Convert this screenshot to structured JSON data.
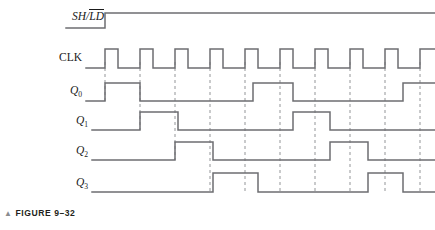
{
  "figure": {
    "caption_marker": "▲",
    "caption": "FIGURE 9–32"
  },
  "style": {
    "trace_color": "#6d6e71",
    "dash_color": "#939598",
    "label_color": "#1a1a1a",
    "background": "#ffffff",
    "trace_width": 1.5,
    "dash_width": 1.0
  },
  "labels": {
    "shld_left": "SH/",
    "shld_overbar": "LD",
    "clk": "CLK",
    "q0": "Q",
    "q0_sub": "0",
    "q1": "Q",
    "q1_sub": "1",
    "q2": "Q",
    "q2_sub": "2",
    "q3": "Q",
    "q3_sub": "3"
  },
  "chart_data": {
    "type": "line",
    "title": "FIGURE 9–32",
    "xlabel": "",
    "ylabel": "",
    "x_start": 105,
    "x_end": 420,
    "clock_period": 35,
    "clock_high_width": 13,
    "clock_pulse_starts": [
      105,
      140,
      175,
      210,
      245,
      280,
      315,
      350,
      385,
      420
    ],
    "gridlines": [
      105,
      140,
      175,
      210,
      245,
      280,
      315,
      350,
      385,
      420
    ],
    "signals": [
      {
        "name": "SH/LD",
        "y_low": 28,
        "y_high": 13,
        "x_from": 66,
        "segments": [
          {
            "x": 66,
            "level": 0
          },
          {
            "x": 105,
            "level": 1
          },
          {
            "x": 435,
            "level": 1
          }
        ]
      },
      {
        "name": "CLK",
        "y_low": 68,
        "y_high": 49,
        "x_from": 86,
        "segments": [
          {
            "x": 86,
            "level": 0
          },
          {
            "x": 105,
            "level": 1
          },
          {
            "x": 118,
            "level": 0
          },
          {
            "x": 140,
            "level": 1
          },
          {
            "x": 153,
            "level": 0
          },
          {
            "x": 175,
            "level": 1
          },
          {
            "x": 188,
            "level": 0
          },
          {
            "x": 210,
            "level": 1
          },
          {
            "x": 223,
            "level": 0
          },
          {
            "x": 245,
            "level": 1
          },
          {
            "x": 258,
            "level": 0
          },
          {
            "x": 280,
            "level": 1
          },
          {
            "x": 293,
            "level": 0
          },
          {
            "x": 315,
            "level": 1
          },
          {
            "x": 328,
            "level": 0
          },
          {
            "x": 350,
            "level": 1
          },
          {
            "x": 363,
            "level": 0
          },
          {
            "x": 385,
            "level": 1
          },
          {
            "x": 398,
            "level": 0
          },
          {
            "x": 420,
            "level": 1
          },
          {
            "x": 435,
            "level": 1
          }
        ]
      },
      {
        "name": "Q0",
        "y_low": 101,
        "y_high": 83,
        "x_from": 86,
        "segments": [
          {
            "x": 86,
            "level": 0
          },
          {
            "x": 105,
            "level": 1
          },
          {
            "x": 140,
            "level": 0
          },
          {
            "x": 253,
            "level": 1
          },
          {
            "x": 293,
            "level": 0
          },
          {
            "x": 403,
            "level": 1
          },
          {
            "x": 435,
            "level": 1
          }
        ]
      },
      {
        "name": "Q1",
        "y_low": 130,
        "y_high": 112,
        "x_from": 92,
        "segments": [
          {
            "x": 92,
            "level": 0
          },
          {
            "x": 140,
            "level": 1
          },
          {
            "x": 178,
            "level": 0
          },
          {
            "x": 293,
            "level": 1
          },
          {
            "x": 330,
            "level": 0
          },
          {
            "x": 435,
            "level": 0
          }
        ]
      },
      {
        "name": "Q2",
        "y_low": 160,
        "y_high": 142,
        "x_from": 92,
        "segments": [
          {
            "x": 92,
            "level": 0
          },
          {
            "x": 175,
            "level": 1
          },
          {
            "x": 213,
            "level": 0
          },
          {
            "x": 330,
            "level": 1
          },
          {
            "x": 368,
            "level": 0
          },
          {
            "x": 435,
            "level": 0
          }
        ]
      },
      {
        "name": "Q3",
        "y_low": 192,
        "y_high": 173,
        "x_from": 92,
        "segments": [
          {
            "x": 92,
            "level": 0
          },
          {
            "x": 213,
            "level": 1
          },
          {
            "x": 258,
            "level": 0
          },
          {
            "x": 368,
            "level": 1
          },
          {
            "x": 403,
            "level": 0
          },
          {
            "x": 435,
            "level": 0
          }
        ]
      }
    ],
    "grid_spans": [
      {
        "x": 105,
        "y1": 62,
        "y2": 101
      },
      {
        "x": 140,
        "y1": 62,
        "y2": 130
      },
      {
        "x": 175,
        "y1": 62,
        "y2": 160
      },
      {
        "x": 210,
        "y1": 62,
        "y2": 192
      },
      {
        "x": 245,
        "y1": 62,
        "y2": 192
      },
      {
        "x": 280,
        "y1": 62,
        "y2": 192
      },
      {
        "x": 315,
        "y1": 62,
        "y2": 192
      },
      {
        "x": 350,
        "y1": 62,
        "y2": 192
      },
      {
        "x": 385,
        "y1": 62,
        "y2": 192
      },
      {
        "x": 420,
        "y1": 62,
        "y2": 192
      }
    ]
  }
}
